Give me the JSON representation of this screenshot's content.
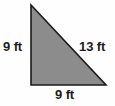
{
  "figure": {
    "shape": "right-triangle",
    "fill_color": "#8c8c8c",
    "stroke_color": "#1a1a1a",
    "background_color": "#fefefe",
    "vertices": {
      "apex": [
        31,
        5
      ],
      "bottom_left": [
        31,
        85
      ],
      "bottom_right": [
        106,
        85
      ]
    },
    "labels": {
      "left_leg": "9 ft",
      "hypotenuse": "13 ft",
      "bottom_leg": "9 ft"
    }
  },
  "chart_data": {
    "type": "diagram",
    "title": "",
    "shape": "right triangle",
    "measurements": [
      {
        "side": "left leg (vertical)",
        "value": 9,
        "unit": "ft",
        "label": "9 ft"
      },
      {
        "side": "bottom leg (horizontal)",
        "value": 9,
        "unit": "ft",
        "label": "9 ft"
      },
      {
        "side": "hypotenuse",
        "value": 13,
        "unit": "ft",
        "label": "13 ft"
      }
    ]
  }
}
